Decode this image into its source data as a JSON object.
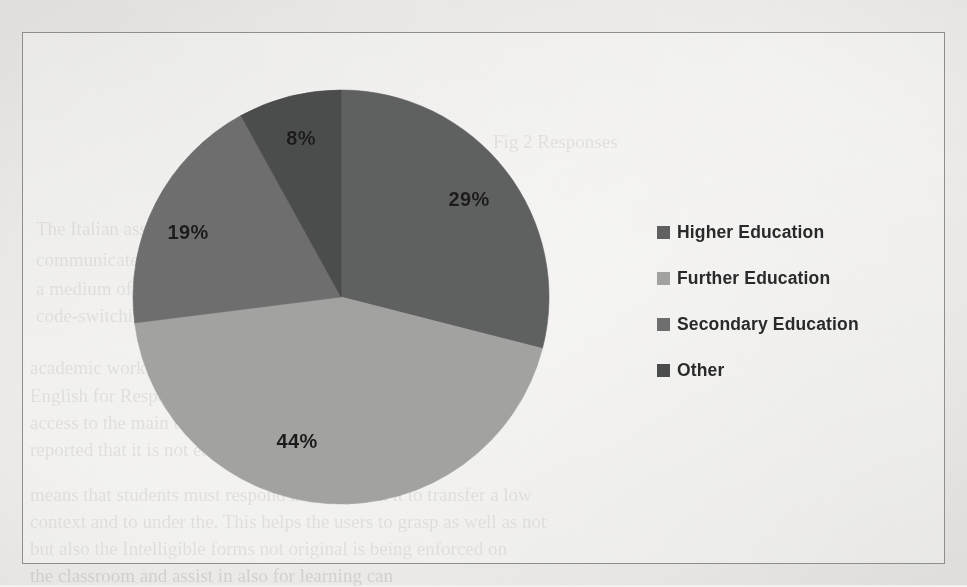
{
  "document": {
    "background_color": "#f2f1ef",
    "frame_border_color": "#8e8e8e",
    "bleedthrough": [
      {
        "text": "Fig 2 Responses",
        "x": 493,
        "y": 131,
        "size": 19,
        "mirror": false
      },
      {
        "text": "The Italian association in the workplace. Students, to",
        "x": 36,
        "y": 218,
        "size": 19,
        "mirror": false
      },
      {
        "text": "communicate in a manner they use to follow. As such",
        "x": 36,
        "y": 249,
        "size": 19,
        "mirror": false
      },
      {
        "text": "a medium of instruction is supported in the classroom",
        "x": 36,
        "y": 278,
        "size": 19,
        "mirror": false
      },
      {
        "text": "code-switching - illustrate in the class",
        "x": 36,
        "y": 305,
        "size": 19,
        "mirror": false
      },
      {
        "text": "academic work and to students who are considered to",
        "x": 30,
        "y": 357,
        "size": 19,
        "mirror": false
      },
      {
        "text": "English for Respondents, as teachers at a school that",
        "x": 30,
        "y": 385,
        "size": 19,
        "mirror": false
      },
      {
        "text": "access to the main text-usage and the structure of the",
        "x": 30,
        "y": 412,
        "size": 19,
        "mirror": false
      },
      {
        "text": "reported that it is not eased",
        "x": 30,
        "y": 439,
        "size": 19,
        "mirror": false
      },
      {
        "text": "means that students must respond in a way that it to transfer a low",
        "x": 30,
        "y": 484,
        "size": 19,
        "mirror": false
      },
      {
        "text": "context and to under the. This helps the users to grasp as well as not",
        "x": 30,
        "y": 511,
        "size": 19,
        "mirror": false
      },
      {
        "text": "but also the  Intelligible forms not original  is being enforced on",
        "x": 30,
        "y": 538,
        "size": 19,
        "mirror": false
      },
      {
        "text": "the classroom and assist in  also for  learning can",
        "x": 30,
        "y": 565,
        "size": 19,
        "mirror": false
      }
    ]
  },
  "chart_data": {
    "type": "pie",
    "title": "",
    "categories": [
      "Higher Education",
      "Further Education",
      "Secondary Education",
      "Other"
    ],
    "values": [
      29,
      44,
      19,
      8
    ],
    "value_unit": "%",
    "data_labels": [
      "29%",
      "44%",
      "19%",
      "8%"
    ],
    "colors": [
      "#5f6060",
      "#a2a3a1",
      "#6d6e6d",
      "#4b4c4c"
    ],
    "start_angle_deg": 0,
    "direction": "clockwise",
    "legend_position": "right",
    "grid": false,
    "geometry": {
      "center_x": 340,
      "center_y": 296,
      "radius_x": 208,
      "radius_y": 207
    },
    "label_positions": [
      {
        "x": 468,
        "y": 198
      },
      {
        "x": 296,
        "y": 440
      },
      {
        "x": 187,
        "y": 231
      },
      {
        "x": 300,
        "y": 137
      }
    ]
  },
  "legend": {
    "items": [
      {
        "label": "Higher Education",
        "color": "#5f6060"
      },
      {
        "label": "Further Education",
        "color": "#a2a3a1"
      },
      {
        "label": "Secondary Education",
        "color": "#6d6e6d"
      },
      {
        "label": "Other",
        "color": "#4b4c4c"
      }
    ]
  }
}
